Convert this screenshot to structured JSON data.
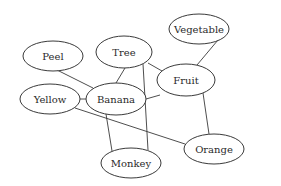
{
  "diagram": {
    "type": "concept-graph",
    "nodes": [
      {
        "id": "peel",
        "label": "Peel",
        "cx": 53,
        "cy": 56,
        "rx": 30,
        "ry": 15
      },
      {
        "id": "tree",
        "label": "Tree",
        "cx": 124,
        "cy": 52,
        "rx": 28,
        "ry": 16
      },
      {
        "id": "vegetable",
        "label": "Vegetable",
        "cx": 199,
        "cy": 29,
        "rx": 30,
        "ry": 15
      },
      {
        "id": "fruit",
        "label": "Fruit",
        "cx": 186,
        "cy": 80,
        "rx": 29,
        "ry": 16
      },
      {
        "id": "yellow",
        "label": "Yellow",
        "cx": 50,
        "cy": 99,
        "rx": 30,
        "ry": 15
      },
      {
        "id": "banana",
        "label": "Banana",
        "cx": 116,
        "cy": 99,
        "rx": 30,
        "ry": 16
      },
      {
        "id": "monkey",
        "label": "Monkey",
        "cx": 131,
        "cy": 163,
        "rx": 30,
        "ry": 15
      },
      {
        "id": "orange",
        "label": "Orange",
        "cx": 214,
        "cy": 149,
        "rx": 30,
        "ry": 15
      }
    ],
    "edges": [
      {
        "from": "peel",
        "to": "banana",
        "x1": 57,
        "y1": 70,
        "x2": 93,
        "y2": 88
      },
      {
        "from": "tree",
        "to": "banana",
        "x1": 125,
        "y1": 68,
        "x2": 116,
        "y2": 83
      },
      {
        "from": "tree",
        "to": "fruit",
        "x1": 148,
        "y1": 63,
        "x2": 162,
        "y2": 71
      },
      {
        "from": "tree",
        "to": "monkey",
        "x1": 143,
        "y1": 64,
        "x2": 148,
        "y2": 150
      },
      {
        "from": "banana",
        "to": "fruit",
        "x1": 146,
        "y1": 99,
        "x2": 160,
        "y2": 95
      },
      {
        "from": "banana",
        "to": "monkey",
        "x1": 106,
        "y1": 114,
        "x2": 112,
        "y2": 151
      },
      {
        "from": "yellow",
        "to": "banana",
        "x1": 80,
        "y1": 99,
        "x2": 86,
        "y2": 99
      },
      {
        "from": "yellow",
        "to": "orange",
        "x1": 75,
        "y1": 108,
        "x2": 185,
        "y2": 144
      },
      {
        "from": "fruit",
        "to": "vegetable",
        "x1": 197,
        "y1": 65,
        "x2": 218,
        "y2": 40
      },
      {
        "from": "fruit",
        "to": "orange",
        "x1": 203,
        "y1": 93,
        "x2": 209,
        "y2": 134
      }
    ]
  }
}
